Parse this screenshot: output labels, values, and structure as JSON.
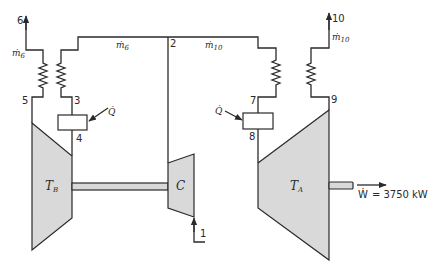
{
  "diagram": {
    "type": "gas turbine power plant schematic",
    "state_points": {
      "p1": "1",
      "p2": "2",
      "p3": "3",
      "p4": "4",
      "p5": "5",
      "p6": "6",
      "p7": "7",
      "p8": "8",
      "p9": "9",
      "p10": "10"
    },
    "flows": {
      "m6_dot": "ṁ",
      "m6_sub": "6",
      "m10_dot": "ṁ",
      "m10_sub": "10"
    },
    "heat": {
      "q_left": "Q̇",
      "q_right": "Q̇"
    },
    "components": {
      "turbine_b": "T",
      "turbine_b_sub": "B",
      "turbine_a": "T",
      "turbine_a_sub": "A",
      "compressor": "C"
    },
    "work_output": {
      "symbol": "Ẇ",
      "text": "= 3750 kW"
    },
    "colors": {
      "line": "#2a2a2a",
      "fill": "#d9d9d9",
      "background": "#ffffff"
    }
  }
}
